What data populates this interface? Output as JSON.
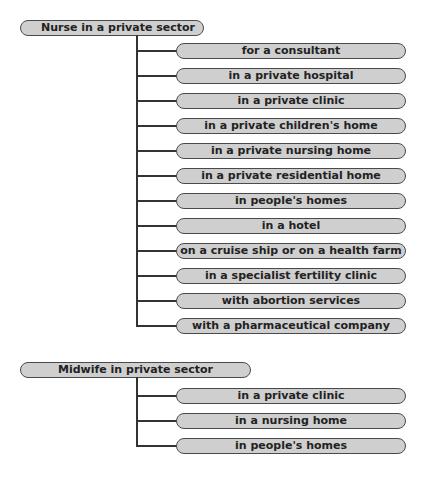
{
  "groups": [
    {
      "title": "Nurse in a private sector",
      "items": [
        "for a consultant",
        "in a private hospital",
        "in a private clinic",
        "in a private children's home",
        "in a private nursing home",
        "in a private residential home",
        "in people's homes",
        "in a hotel",
        "on a cruise ship or on a health farm",
        "in a specialist fertility clinic",
        "with abortion services",
        "with a pharmaceutical company"
      ]
    },
    {
      "title": "Midwife in private sector",
      "items": [
        "in a private clinic",
        "in a nursing home",
        "in people's homes"
      ]
    }
  ],
  "colors": {
    "pill_fill": "#cfcfcf",
    "pill_border": "#4a4a4a",
    "line": "#333333"
  }
}
